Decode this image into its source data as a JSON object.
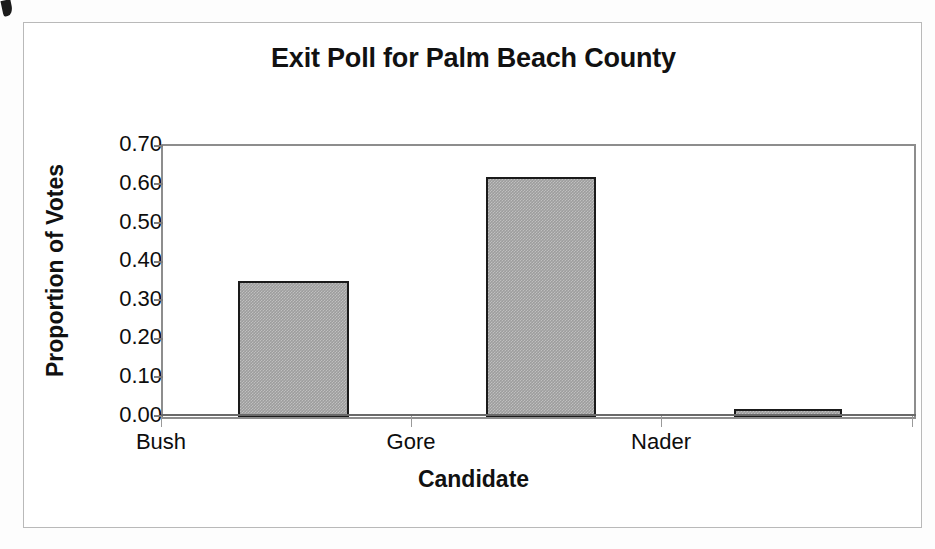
{
  "chart_data": {
    "type": "bar",
    "title": "Exit Poll for Palm Beach County",
    "xlabel": "Candidate",
    "ylabel": "Proportion of Votes",
    "categories": [
      "Bush",
      "Gore",
      "Nader"
    ],
    "values": [
      0.35,
      0.62,
      0.02
    ],
    "ylim": [
      0.0,
      0.7
    ],
    "ytick_labels": [
      "0.70",
      "0.60",
      "0.50",
      "0.40",
      "0.30",
      "0.20",
      "0.10",
      "0.00"
    ],
    "ytick_values": [
      0.7,
      0.6,
      0.5,
      0.4,
      0.3,
      0.2,
      0.1,
      0.0
    ],
    "grid": false,
    "legend": "none",
    "bar_fill_color": "#9d9d9d",
    "bar_border_color": "#1a1a1a",
    "plot_border_color": "#8d8d8d",
    "text_color": "#0d0d0d",
    "background_color": "#ffffff"
  }
}
